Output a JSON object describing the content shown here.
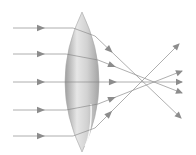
{
  "diagram": {
    "title": "",
    "type": "converging-lens-ray-diagram",
    "colors": {
      "background": "#ffffff",
      "ray": "#9a9a9a",
      "arrow": "#8c8c8c",
      "lens_light": "#e6e6e6",
      "lens_mid": "#c4c4c4",
      "lens_dark": "#9e9e9e",
      "highlight": "#ffffff"
    },
    "lens": {
      "cx": 82,
      "top": 12,
      "bottom": 152,
      "half_width": 17
    },
    "focal_point": {
      "x": 143,
      "y": 82
    },
    "rays": [
      {
        "y_in": 28,
        "x_enter": 73,
        "x_exit": 95,
        "y_exit": 36,
        "end": [
          181,
          118
        ]
      },
      {
        "y_in": 54,
        "x_enter": 66,
        "x_exit": 98,
        "y_exit": 60,
        "end": [
          182,
          93
        ]
      },
      {
        "y_in": 82,
        "x_enter": 64,
        "x_exit": 99,
        "y_exit": 82,
        "end": [
          182,
          82
        ]
      },
      {
        "y_in": 110,
        "x_enter": 66,
        "x_exit": 98,
        "y_exit": 104,
        "end": [
          182,
          71
        ]
      },
      {
        "y_in": 136,
        "x_enter": 73,
        "x_exit": 95,
        "y_exit": 128,
        "end": [
          179,
          44
        ]
      }
    ],
    "ray_start_x": 13,
    "input_arrow_x": 42
  }
}
